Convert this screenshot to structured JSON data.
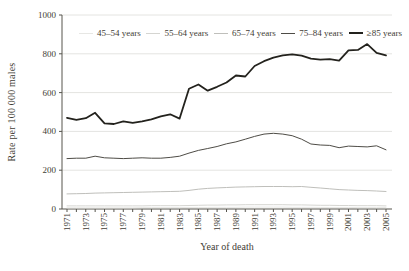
{
  "figure": {
    "background": "#ffffff",
    "text_color": "#3f3d35",
    "axis_color": "#56544d",
    "grid_color": "#e4e4e1"
  },
  "chart_data": {
    "type": "line",
    "title": "",
    "xlabel": "Year of death",
    "ylabel": "Rate per 100 000 males",
    "x": [
      1971,
      1972,
      1973,
      1974,
      1975,
      1976,
      1977,
      1978,
      1979,
      1980,
      1981,
      1982,
      1983,
      1984,
      1985,
      1986,
      1987,
      1988,
      1989,
      1990,
      1991,
      1992,
      1993,
      1994,
      1995,
      1996,
      1997,
      1998,
      1999,
      2000,
      2001,
      2002,
      2003,
      2004,
      2005
    ],
    "x_tick_labels": [
      "1971",
      "1973",
      "1975",
      "1977",
      "1979",
      "1981",
      "1983",
      "1985",
      "1987",
      "1989",
      "1991",
      "1993",
      "1995",
      "1997",
      "1999",
      "2001",
      "2003",
      "2005"
    ],
    "y_ticks": [
      0,
      200,
      400,
      600,
      800,
      1000
    ],
    "ylim": [
      0,
      1000
    ],
    "grid": "horizontal",
    "legend_position": "top-inside",
    "series": [
      {
        "id": "45-54",
        "name": "45–54 years",
        "color": "#e7e7e4",
        "width": 1,
        "values": [
          6,
          6,
          6,
          6,
          6,
          6,
          6,
          6,
          7,
          7,
          7,
          7,
          7,
          8,
          8,
          8,
          9,
          9,
          9,
          10,
          10,
          10,
          10,
          10,
          9,
          9,
          9,
          8,
          8,
          8,
          8,
          7,
          7,
          7,
          7
        ]
      },
      {
        "id": "55-64",
        "name": "55–64 years",
        "color": "#d5d5d1",
        "width": 1,
        "values": [
          16,
          16,
          16,
          16,
          16,
          16,
          16,
          16,
          16,
          17,
          17,
          17,
          17,
          18,
          19,
          20,
          20,
          21,
          21,
          22,
          22,
          22,
          22,
          22,
          21,
          21,
          20,
          19,
          19,
          18,
          18,
          17,
          17,
          17,
          16
        ]
      },
      {
        "id": "65-74",
        "name": "65–74 years",
        "color": "#bfbfbb",
        "width": 1,
        "values": [
          78,
          79,
          80,
          82,
          83,
          84,
          85,
          86,
          87,
          88,
          89,
          90,
          91,
          96,
          102,
          106,
          109,
          111,
          113,
          114,
          115,
          116,
          116,
          116,
          115,
          116,
          112,
          108,
          104,
          100,
          98,
          96,
          95,
          93,
          90
        ]
      },
      {
        "id": "75-84",
        "name": "75–84 years",
        "color": "#4e4c46",
        "width": 1,
        "values": [
          260,
          262,
          262,
          272,
          264,
          262,
          260,
          262,
          264,
          262,
          262,
          266,
          272,
          288,
          302,
          312,
          322,
          336,
          346,
          360,
          374,
          386,
          390,
          386,
          378,
          360,
          335,
          330,
          328,
          316,
          324,
          322,
          320,
          326,
          305
        ]
      },
      {
        "id": "85-plus",
        "name": "≥85 years",
        "color": "#23221d",
        "width": 1.8,
        "values": [
          470,
          460,
          468,
          496,
          442,
          438,
          452,
          444,
          452,
          462,
          478,
          488,
          466,
          620,
          642,
          610,
          630,
          652,
          688,
          683,
          737,
          762,
          780,
          792,
          797,
          790,
          775,
          770,
          772,
          765,
          818,
          820,
          850,
          805,
          792
        ]
      }
    ]
  }
}
